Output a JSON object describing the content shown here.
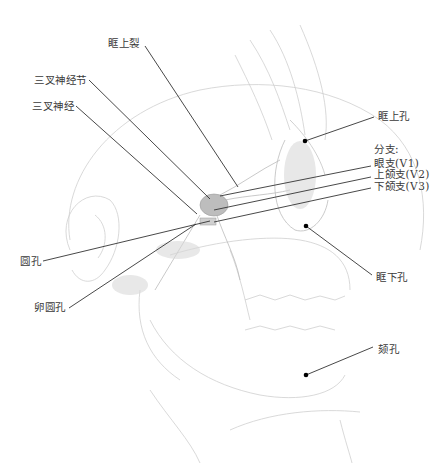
{
  "diagram": {
    "colors": {
      "background": "#ffffff",
      "leader_line": "#333333",
      "dot": "#000000",
      "sketch": "#c8c8c8",
      "text": "#3a3a3a"
    },
    "labels": {
      "superior_orbital_fissure": "眶上裂",
      "trigeminal_ganglion": "三叉神经节",
      "trigeminal_nerve": "三叉神经",
      "supraorbital_foramen": "眶上孔",
      "branches_heading": "分支:",
      "ophthalmic_branch": "眼支(V1)",
      "maxillary_branch": "上颌支(V2)",
      "mandibular_branch": "下颌支(V3)",
      "foramen_rotundum": "圆孔",
      "foramen_ovale": "卵圆孔",
      "infraorbital_foramen": "眶下孔",
      "mental_foramen": "颏孔"
    }
  }
}
